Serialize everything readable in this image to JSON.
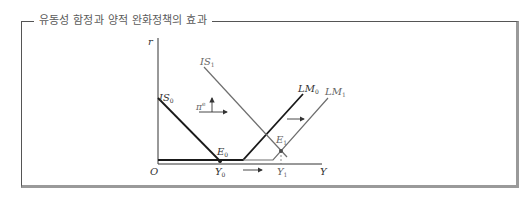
{
  "figure": {
    "title": "유동성 함정과 양적 완화정책의 효과"
  },
  "axes": {
    "y_label": "r",
    "x_label": "Y",
    "origin_label": "O"
  },
  "curves": {
    "is0": {
      "label": "IS",
      "sub": "0"
    },
    "is1": {
      "label": "IS",
      "sub": "1"
    },
    "lm0": {
      "label": "LM",
      "sub": "0"
    },
    "lm1": {
      "label": "LM",
      "sub": "1"
    }
  },
  "points": {
    "e0": {
      "label": "E",
      "sub": "0"
    },
    "e1": {
      "label": "E",
      "sub": "1"
    },
    "y0": {
      "label": "Y",
      "sub": "0"
    },
    "y1": {
      "label": "Y",
      "sub": "1"
    }
  },
  "annotations": {
    "inflation_expectation": {
      "label": "π",
      "sup": "e"
    }
  },
  "colors": {
    "primary_line": "#1a1a1a",
    "secondary_line": "#6e6e6e",
    "frame_shadow": "#9a9a9a",
    "title_text": "#5a5a5a"
  }
}
